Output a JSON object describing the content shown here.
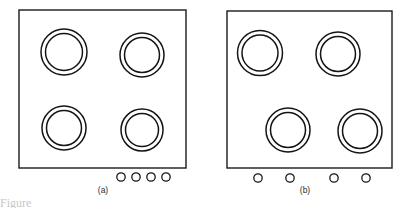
{
  "figure": {
    "background_color": "#ffffff",
    "line_color": "#1a1a1a",
    "clipped_caption": "Figure",
    "panels": [
      {
        "id": "a",
        "label": "(a)",
        "label_x": 103,
        "label_y": 193,
        "description": "Regular 2x2 burner grid with four clustered control knobs",
        "cooktop": {
          "x": 19,
          "y": 10,
          "width": 167,
          "height": 158
        },
        "burners": [
          {
            "name": "burner-top-left",
            "cx": 64,
            "cy": 52,
            "r_outer": 23,
            "r_inner": 18.5
          },
          {
            "name": "burner-top-right",
            "cx": 142,
            "cy": 55,
            "r_outer": 22,
            "r_inner": 17.5
          },
          {
            "name": "burner-bottom-left",
            "cx": 64,
            "cy": 128,
            "r_outer": 22,
            "r_inner": 17.5
          },
          {
            "name": "burner-bottom-right",
            "cx": 142,
            "cy": 130,
            "r_outer": 21,
            "r_inner": 16.5
          }
        ],
        "knobs": [
          {
            "name": "knob-1",
            "cx": 121,
            "cy": 177,
            "r": 4.2
          },
          {
            "name": "knob-2",
            "cx": 136,
            "cy": 177,
            "r": 4.2
          },
          {
            "name": "knob-3",
            "cx": 151,
            "cy": 177,
            "r": 4.2
          },
          {
            "name": "knob-4",
            "cx": 166,
            "cy": 177,
            "r": 4.2
          }
        ]
      },
      {
        "id": "b",
        "label": "(b)",
        "label_x": 305,
        "label_y": 193,
        "description": "Staggered burner arrangement with knobs spatially matched to burners",
        "cooktop": {
          "x": 227,
          "y": 11,
          "width": 165,
          "height": 157
        },
        "burners": [
          {
            "name": "burner-top-left",
            "cx": 260,
            "cy": 53,
            "r_outer": 22.5,
            "r_inner": 18
          },
          {
            "name": "burner-top-right",
            "cx": 338,
            "cy": 54,
            "r_outer": 22,
            "r_inner": 17.5
          },
          {
            "name": "burner-bottom-left",
            "cx": 288,
            "cy": 130,
            "r_outer": 22,
            "r_inner": 17.5
          },
          {
            "name": "burner-bottom-right",
            "cx": 360,
            "cy": 131,
            "r_outer": 22,
            "r_inner": 17.5
          }
        ],
        "knobs": [
          {
            "name": "knob-1",
            "cx": 258,
            "cy": 178,
            "r": 4.2
          },
          {
            "name": "knob-2",
            "cx": 290,
            "cy": 178,
            "r": 4.2
          },
          {
            "name": "knob-3",
            "cx": 334,
            "cy": 178,
            "r": 4.2
          },
          {
            "name": "knob-4",
            "cx": 366,
            "cy": 178,
            "r": 4.2
          }
        ]
      }
    ]
  }
}
